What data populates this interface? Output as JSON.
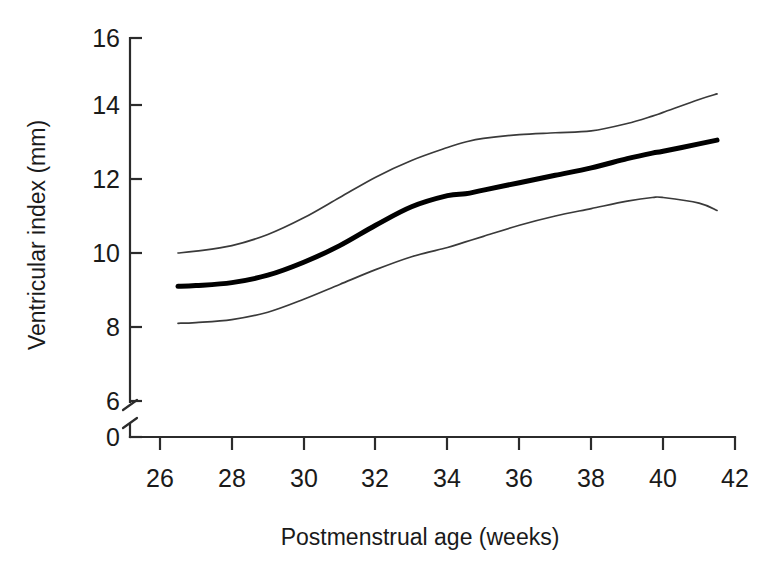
{
  "chart_data": {
    "type": "line",
    "title": "",
    "xlabel": "Postmenstrual age (weeks)",
    "ylabel": "Ventricular index (mm)",
    "xlim": [
      26,
      42
    ],
    "ylim": [
      0,
      16
    ],
    "y_axis_break": {
      "from": 0,
      "to": 6,
      "present": true
    },
    "xticks": [
      26,
      28,
      30,
      32,
      34,
      36,
      38,
      40,
      42
    ],
    "yticks": [
      0,
      6,
      8,
      10,
      12,
      14,
      16
    ],
    "grid": false,
    "legend": "none",
    "x": [
      26.5,
      27,
      28,
      29,
      30,
      31,
      32,
      33,
      34,
      34.5,
      35,
      36,
      37,
      38,
      39,
      39.7,
      40,
      41,
      41.5
    ],
    "series": [
      {
        "name": "97th centile (upper band)",
        "style": "thin",
        "values": [
          10.0,
          10.05,
          10.2,
          10.5,
          10.95,
          11.5,
          12.05,
          12.5,
          12.85,
          13.0,
          13.1,
          13.2,
          13.25,
          13.3,
          13.5,
          13.7,
          13.8,
          14.15,
          14.3
        ]
      },
      {
        "name": "Mean ventricular index (median)",
        "style": "thick",
        "values": [
          9.1,
          9.12,
          9.2,
          9.4,
          9.75,
          10.2,
          10.75,
          11.25,
          11.55,
          11.6,
          11.7,
          11.9,
          12.1,
          12.3,
          12.55,
          12.7,
          12.75,
          12.95,
          13.05
        ]
      },
      {
        "name": "3rd centile (lower band)",
        "style": "thin",
        "values": [
          8.1,
          8.12,
          8.2,
          8.4,
          8.75,
          9.15,
          9.55,
          9.9,
          10.15,
          10.3,
          10.45,
          10.75,
          11.0,
          11.2,
          11.4,
          11.5,
          11.5,
          11.35,
          11.15
        ]
      }
    ]
  },
  "axes": {
    "x_title": "Postmenstrual age (weeks)",
    "y_title": "Ventricular index (mm)",
    "x_tick_labels": [
      "26",
      "28",
      "30",
      "32",
      "34",
      "36",
      "38",
      "40",
      "42"
    ],
    "y_tick_labels": [
      "0",
      "6",
      "8",
      "10",
      "12",
      "14",
      "16"
    ]
  },
  "colors": {
    "background": "#ffffff",
    "axis": "#2b2b2b",
    "median_curve": "#000000",
    "band_curve": "#3a3a3a",
    "text": "#1a1a1a"
  }
}
